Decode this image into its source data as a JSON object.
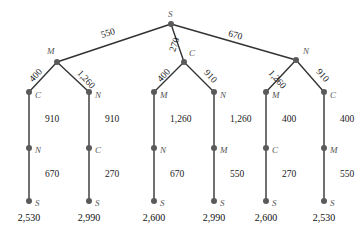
{
  "chart_data": {
    "type": "diagram",
    "title": "",
    "node_color": "#5a5a5a",
    "edge_color": "#333333",
    "label_color": "#555555",
    "value_color": "#111111",
    "root": {
      "id": "root",
      "label": "S",
      "x": 171,
      "y": 24,
      "label_x": 168,
      "label_y": 10
    },
    "nodes": [
      {
        "id": "n-l2-a",
        "label": "M",
        "x": 57,
        "y": 62,
        "label_x": 47,
        "label_y": 47
      },
      {
        "id": "n-l2-b",
        "label": "C",
        "x": 184,
        "y": 62,
        "label_x": 189,
        "label_y": 49
      },
      {
        "id": "n-l2-c",
        "label": "N",
        "x": 296,
        "y": 60,
        "label_x": 303,
        "label_y": 47
      },
      {
        "id": "n-l3-1",
        "label": "C",
        "x": 29,
        "y": 92,
        "label_x": 35,
        "label_y": 91
      },
      {
        "id": "n-l3-2",
        "label": "N",
        "x": 89,
        "y": 92,
        "label_x": 95,
        "label_y": 91
      },
      {
        "id": "n-l3-3",
        "label": "M",
        "x": 154,
        "y": 92,
        "label_x": 160,
        "label_y": 91
      },
      {
        "id": "n-l3-4",
        "label": "N",
        "x": 214,
        "y": 92,
        "label_x": 220,
        "label_y": 91
      },
      {
        "id": "n-l3-5",
        "label": "M",
        "x": 266,
        "y": 92,
        "label_x": 272,
        "label_y": 91
      },
      {
        "id": "n-l3-6",
        "label": "C",
        "x": 324,
        "y": 92,
        "label_x": 330,
        "label_y": 91
      },
      {
        "id": "n-l4-1",
        "label": "N",
        "x": 29,
        "y": 148,
        "label_x": 35,
        "label_y": 146
      },
      {
        "id": "n-l4-2",
        "label": "C",
        "x": 89,
        "y": 148,
        "label_x": 95,
        "label_y": 146
      },
      {
        "id": "n-l4-3",
        "label": "N",
        "x": 154,
        "y": 148,
        "label_x": 160,
        "label_y": 146
      },
      {
        "id": "n-l4-4",
        "label": "M",
        "x": 214,
        "y": 148,
        "label_x": 220,
        "label_y": 146
      },
      {
        "id": "n-l4-5",
        "label": "C",
        "x": 266,
        "y": 148,
        "label_x": 272,
        "label_y": 146
      },
      {
        "id": "n-l4-6",
        "label": "M",
        "x": 324,
        "y": 148,
        "label_x": 330,
        "label_y": 146
      },
      {
        "id": "n-l5-1",
        "label": "S",
        "x": 29,
        "y": 201,
        "label_x": 35,
        "label_y": 199
      },
      {
        "id": "n-l5-2",
        "label": "S",
        "x": 89,
        "y": 201,
        "label_x": 95,
        "label_y": 199
      },
      {
        "id": "n-l5-3",
        "label": "S",
        "x": 154,
        "y": 201,
        "label_x": 160,
        "label_y": 199
      },
      {
        "id": "n-l5-4",
        "label": "S",
        "x": 214,
        "y": 201,
        "label_x": 220,
        "label_y": 199
      },
      {
        "id": "n-l5-5",
        "label": "S",
        "x": 266,
        "y": 201,
        "label_x": 272,
        "label_y": 199
      },
      {
        "id": "n-l5-6",
        "label": "S",
        "x": 324,
        "y": 201,
        "label_x": 330,
        "label_y": 199
      }
    ],
    "edges": [
      {
        "id": "e-root-a",
        "x1": 171,
        "y1": 24,
        "x2": 57,
        "y2": 62
      },
      {
        "id": "e-root-b",
        "x1": 171,
        "y1": 24,
        "x2": 184,
        "y2": 62
      },
      {
        "id": "e-root-c",
        "x1": 171,
        "y1": 24,
        "x2": 296,
        "y2": 60
      },
      {
        "id": "e-a-1",
        "x1": 57,
        "y1": 62,
        "x2": 29,
        "y2": 92
      },
      {
        "id": "e-a-2",
        "x1": 57,
        "y1": 62,
        "x2": 89,
        "y2": 92
      },
      {
        "id": "e-b-3",
        "x1": 184,
        "y1": 62,
        "x2": 154,
        "y2": 92
      },
      {
        "id": "e-b-4",
        "x1": 184,
        "y1": 62,
        "x2": 214,
        "y2": 92
      },
      {
        "id": "e-c-5",
        "x1": 296,
        "y1": 60,
        "x2": 266,
        "y2": 92
      },
      {
        "id": "e-c-6",
        "x1": 296,
        "y1": 60,
        "x2": 324,
        "y2": 92
      },
      {
        "id": "e-v3-1",
        "x1": 29,
        "y1": 92,
        "x2": 29,
        "y2": 148
      },
      {
        "id": "e-v3-2",
        "x1": 89,
        "y1": 92,
        "x2": 89,
        "y2": 148
      },
      {
        "id": "e-v3-3",
        "x1": 154,
        "y1": 92,
        "x2": 154,
        "y2": 148
      },
      {
        "id": "e-v3-4",
        "x1": 214,
        "y1": 92,
        "x2": 214,
        "y2": 148
      },
      {
        "id": "e-v3-5",
        "x1": 266,
        "y1": 92,
        "x2": 266,
        "y2": 148
      },
      {
        "id": "e-v3-6",
        "x1": 324,
        "y1": 92,
        "x2": 324,
        "y2": 148
      },
      {
        "id": "e-v4-1",
        "x1": 29,
        "y1": 148,
        "x2": 29,
        "y2": 201
      },
      {
        "id": "e-v4-2",
        "x1": 89,
        "y1": 148,
        "x2": 89,
        "y2": 201
      },
      {
        "id": "e-v4-3",
        "x1": 154,
        "y1": 148,
        "x2": 154,
        "y2": 201
      },
      {
        "id": "e-v4-4",
        "x1": 214,
        "y1": 148,
        "x2": 214,
        "y2": 201
      },
      {
        "id": "e-v4-5",
        "x1": 266,
        "y1": 148,
        "x2": 266,
        "y2": 201
      },
      {
        "id": "e-v4-6",
        "x1": 324,
        "y1": 148,
        "x2": 324,
        "y2": 201
      }
    ],
    "edge_labels": [
      {
        "id": "el-root-a",
        "text": "550",
        "x": 101,
        "y": 29,
        "rotate": -17
      },
      {
        "id": "el-root-b",
        "text": "270",
        "x": 168,
        "y": 40,
        "rotate": -72
      },
      {
        "id": "el-root-c",
        "text": "670",
        "x": 228,
        "y": 31,
        "rotate": 16
      },
      {
        "id": "el-a-1",
        "text": "400",
        "x": 29,
        "y": 71,
        "rotate": -47
      },
      {
        "id": "el-a-2",
        "text": "1,260",
        "x": 75,
        "y": 75,
        "rotate": 47
      },
      {
        "id": "el-b-3",
        "text": "400",
        "x": 157,
        "y": 71,
        "rotate": -47
      },
      {
        "id": "el-b-4",
        "text": "910",
        "x": 203,
        "y": 72,
        "rotate": 47
      },
      {
        "id": "el-c-5",
        "text": "1,260",
        "x": 266,
        "y": 75,
        "rotate": 48
      },
      {
        "id": "el-c-6",
        "text": "910",
        "x": 315,
        "y": 71,
        "rotate": 48
      },
      {
        "id": "el-v3-1",
        "text": "910",
        "x": 45,
        "y": 115,
        "rotate": 0
      },
      {
        "id": "el-v3-2",
        "text": "910",
        "x": 105,
        "y": 115,
        "rotate": 0
      },
      {
        "id": "el-v3-3",
        "text": "1,260",
        "x": 170,
        "y": 115,
        "rotate": 0
      },
      {
        "id": "el-v3-4",
        "text": "1,260",
        "x": 230,
        "y": 115,
        "rotate": 0
      },
      {
        "id": "el-v3-5",
        "text": "400",
        "x": 282,
        "y": 115,
        "rotate": 0
      },
      {
        "id": "el-v3-6",
        "text": "400",
        "x": 340,
        "y": 115,
        "rotate": 0
      },
      {
        "id": "el-v4-1",
        "text": "670",
        "x": 45,
        "y": 170,
        "rotate": 0
      },
      {
        "id": "el-v4-2",
        "text": "270",
        "x": 105,
        "y": 170,
        "rotate": 0
      },
      {
        "id": "el-v4-3",
        "text": "670",
        "x": 170,
        "y": 170,
        "rotate": 0
      },
      {
        "id": "el-v4-4",
        "text": "550",
        "x": 230,
        "y": 170,
        "rotate": 0
      },
      {
        "id": "el-v4-5",
        "text": "270",
        "x": 282,
        "y": 170,
        "rotate": 0
      },
      {
        "id": "el-v4-6",
        "text": "550",
        "x": 340,
        "y": 170,
        "rotate": 0
      }
    ],
    "totals": [
      {
        "id": "total-1",
        "text": "2,530",
        "x": 29,
        "y": 213
      },
      {
        "id": "total-2",
        "text": "2,990",
        "x": 89,
        "y": 213
      },
      {
        "id": "total-3",
        "text": "2,600",
        "x": 154,
        "y": 213
      },
      {
        "id": "total-4",
        "text": "2,990",
        "x": 214,
        "y": 213
      },
      {
        "id": "total-5",
        "text": "2,600",
        "x": 266,
        "y": 213
      },
      {
        "id": "total-6",
        "text": "2,530",
        "x": 324,
        "y": 213
      }
    ],
    "routes": [
      {
        "path": [
          "S",
          "M",
          "C",
          "N",
          "S"
        ],
        "legs": [
          550,
          400,
          910,
          670
        ],
        "total": 2530
      },
      {
        "path": [
          "S",
          "M",
          "N",
          "C",
          "S"
        ],
        "legs": [
          550,
          1260,
          910,
          270
        ],
        "total": 2990
      },
      {
        "path": [
          "S",
          "C",
          "M",
          "N",
          "S"
        ],
        "legs": [
          270,
          400,
          1260,
          670
        ],
        "total": 2600
      },
      {
        "path": [
          "S",
          "C",
          "N",
          "M",
          "S"
        ],
        "legs": [
          270,
          910,
          1260,
          550
        ],
        "total": 2990
      },
      {
        "path": [
          "S",
          "N",
          "M",
          "C",
          "S"
        ],
        "legs": [
          670,
          1260,
          400,
          270
        ],
        "total": 2600
      },
      {
        "path": [
          "S",
          "N",
          "C",
          "M",
          "S"
        ],
        "legs": [
          670,
          910,
          400,
          550
        ],
        "total": 2530
      }
    ]
  }
}
